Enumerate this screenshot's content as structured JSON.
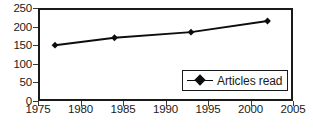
{
  "chart_data": {
    "type": "line",
    "title": "",
    "xlabel": "",
    "ylabel": "",
    "x": [
      1977,
      1984,
      1993,
      2002
    ],
    "series": [
      {
        "name": "Articles read",
        "values": [
          150,
          170,
          185,
          215
        ]
      }
    ],
    "xlim": [
      1975,
      2005
    ],
    "ylim": [
      0,
      250
    ],
    "x_ticks": [
      1975,
      1980,
      1985,
      1990,
      1995,
      2000,
      2005
    ],
    "y_ticks": [
      0,
      50,
      100,
      150,
      200,
      250
    ],
    "grid": false,
    "legend_position": "inside-bottom-right",
    "marker": "diamond",
    "line_color": "#0d0d0d",
    "marker_color": "#0d0d0d",
    "frame_color": "#1a1a1a",
    "background": "#ffffff"
  },
  "legend": {
    "entries": [
      {
        "label": "Articles read",
        "marker_icon": "diamond-marker-icon"
      }
    ]
  },
  "axes": {
    "y_tick_labels": [
      "250",
      "200",
      "150",
      "100",
      "50",
      "0"
    ],
    "x_tick_labels": [
      "1975",
      "1980",
      "1985",
      "1990",
      "1995",
      "2000",
      "2005"
    ]
  },
  "caption": {
    "partial_text": ""
  }
}
